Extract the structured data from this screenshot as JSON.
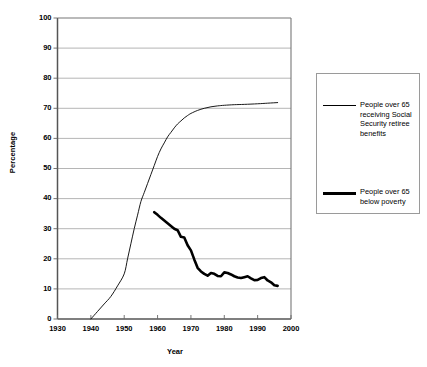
{
  "chart_data": {
    "type": "line",
    "title": "",
    "xlabel": "Year",
    "ylabel": "Percentage",
    "xlim": [
      1930,
      2000
    ],
    "ylim": [
      0,
      100
    ],
    "grid": true,
    "grid_axis": "y",
    "legend_position": "right",
    "xticks": [
      1930,
      1940,
      1950,
      1960,
      1970,
      1980,
      1990,
      2000
    ],
    "xtick_labels": [
      "1930",
      "1940",
      "1950",
      "1960",
      "1970",
      "1980",
      "1990",
      "2000"
    ],
    "yticks": [
      0,
      10,
      20,
      30,
      40,
      50,
      60,
      70,
      80,
      90,
      100
    ],
    "ytick_labels": [
      "0",
      "10",
      "20",
      "30",
      "40",
      "50",
      "60",
      "70",
      "80",
      "90",
      "100"
    ],
    "series": [
      {
        "name": "People over 65 receiving Social Security retiree benefits",
        "style": "thin",
        "color": "#000000",
        "linewidth": 0.9,
        "x": [
          1940,
          1942,
          1944,
          1946,
          1948,
          1950,
          1951,
          1952,
          1953,
          1954,
          1955,
          1956,
          1957,
          1958,
          1959,
          1960,
          1961,
          1962,
          1963,
          1964,
          1965,
          1966,
          1967,
          1968,
          1969,
          1970,
          1972,
          1974,
          1976,
          1978,
          1980,
          1983,
          1986,
          1990,
          1993,
          1996
        ],
        "y": [
          0,
          2.5,
          5,
          7.5,
          11,
          15,
          20,
          25,
          30,
          34.5,
          39,
          42,
          45,
          48,
          51,
          54,
          56.5,
          58.5,
          60.5,
          62,
          63.5,
          64.8,
          65.8,
          66.8,
          67.6,
          68.3,
          69.3,
          70.0,
          70.5,
          70.8,
          71.0,
          71.2,
          71.3,
          71.5,
          71.7,
          71.9
        ]
      },
      {
        "name": "People over 65 below poverty",
        "style": "thick",
        "color": "#000000",
        "linewidth": 2.6,
        "x": [
          1959,
          1960,
          1961,
          1962,
          1963,
          1964,
          1965,
          1966,
          1967,
          1968,
          1969,
          1970,
          1971,
          1972,
          1973,
          1974,
          1975,
          1976,
          1977,
          1978,
          1979,
          1980,
          1981,
          1982,
          1983,
          1984,
          1985,
          1986,
          1987,
          1988,
          1989,
          1990,
          1991,
          1992,
          1993,
          1994,
          1995,
          1996
        ],
        "y": [
          35.5,
          34.6,
          33.6,
          32.7,
          31.8,
          30.9,
          30.0,
          29.5,
          27.3,
          27.1,
          24.5,
          22.8,
          19.8,
          17.0,
          15.8,
          15.0,
          14.4,
          15.3,
          15.0,
          14.3,
          14.2,
          15.5,
          15.3,
          14.8,
          14.2,
          13.8,
          13.6,
          13.9,
          14.2,
          13.5,
          12.9,
          13.0,
          13.6,
          13.9,
          12.8,
          12.2,
          11.2,
          11.0
        ]
      }
    ]
  },
  "legend": {
    "entries": [
      {
        "label": "People over 65 receiving Social Security retiree benefits",
        "swatch": "thin-line-swatch"
      },
      {
        "label": "People over 65 below poverty",
        "swatch": "thick-line-swatch"
      }
    ]
  }
}
